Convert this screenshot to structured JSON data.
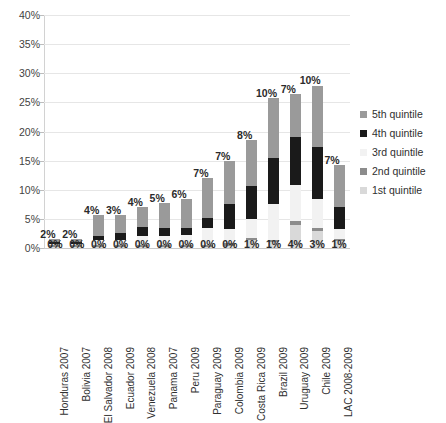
{
  "chart_data": {
    "type": "bar",
    "stacked": true,
    "title": "",
    "xlabel": "",
    "ylabel": "",
    "ylim": [
      0,
      40
    ],
    "ytick_labels": [
      "0%",
      "5%",
      "10%",
      "15%",
      "20%",
      "25%",
      "30%",
      "35%",
      "40%"
    ],
    "ytick_values": [
      0,
      5,
      10,
      15,
      20,
      25,
      30,
      35,
      40
    ],
    "grid": true,
    "legend_position": "right",
    "categories": [
      "Honduras 2007",
      "Bolivia 2007",
      "El Salvador 2008",
      "Ecuador 2009",
      "Venezuela 2008",
      "Panama 2007",
      "Peru 2009",
      "Paraguay 2009",
      "Colombia 2009",
      "Costa Rica 2009",
      "Brazil 2009",
      "Uruguay 2009",
      "Chile 2009",
      "LAC 2008-2009"
    ],
    "series": [
      {
        "name": "1st quintile",
        "color": "#d9d9d9",
        "values": [
          0.2,
          0.2,
          0.2,
          0.2,
          0.2,
          0.2,
          0.2,
          0.2,
          0.3,
          1.3,
          1.0,
          4.0,
          3.0,
          1.2
        ]
      },
      {
        "name": "2nd quintile",
        "color": "#8c8c8c",
        "values": [
          0.3,
          0.3,
          0.3,
          0.3,
          0.3,
          0.3,
          0.4,
          0.4,
          0.5,
          0.5,
          0.4,
          0.6,
          0.5,
          0.4
        ]
      },
      {
        "name": "3rd quintile",
        "color": "#f2f2f2",
        "values": [
          0.2,
          0.2,
          0.8,
          0.9,
          1.5,
          1.6,
          1.6,
          2.8,
          2.5,
          3.1,
          6.1,
          6.2,
          4.9,
          1.7
        ]
      },
      {
        "name": "4th quintile",
        "color": "#1a1a1a",
        "values": [
          0.3,
          0.3,
          0.8,
          1.1,
          1.6,
          1.4,
          1.2,
          1.7,
          4.2,
          5.7,
          8.0,
          8.3,
          9.0,
          3.8
        ]
      },
      {
        "name": "5th quintile",
        "color": "#9a9a9a",
        "values": [
          0.6,
          0.6,
          3.6,
          3.2,
          3.5,
          4.3,
          5.0,
          6.9,
          7.5,
          7.9,
          10.2,
          7.3,
          10.5,
          7.2
        ]
      }
    ],
    "bottom_labels": [
      "0%",
      "0%",
      "0%",
      "0%",
      "0%",
      "0%",
      "0%",
      "0%",
      "0%",
      "1%",
      "1%",
      "4%",
      "3%",
      "1%"
    ],
    "top_labels": [
      "2%",
      "2%",
      "4%",
      "3%",
      "4%",
      "5%",
      "6%",
      "7%",
      "7%",
      "8%",
      "10%",
      "7%",
      "10%",
      "7%"
    ],
    "legend": [
      {
        "label": "5th quintile",
        "color": "#9a9a9a"
      },
      {
        "label": "4th quintile",
        "color": "#1a1a1a"
      },
      {
        "label": "3rd quintile",
        "color": "#f2f2f2"
      },
      {
        "label": "2nd quintile",
        "color": "#8c8c8c"
      },
      {
        "label": "1st quintile",
        "color": "#d9d9d9"
      }
    ]
  }
}
